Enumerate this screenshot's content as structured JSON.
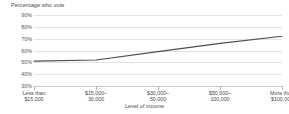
{
  "chart_data": {
    "type": "line",
    "title": "",
    "ylabel": "Percentage who vote",
    "xlabel": "Level of income",
    "categories": [
      "Less than\n$15,000",
      "$15,000–\n30,000",
      "$30,000–\n50,000",
      "$50,000–\n100,000",
      "More than\n$100,000"
    ],
    "category_lines": [
      [
        "Less than",
        "$15,000"
      ],
      [
        "$15,000–",
        "30,000"
      ],
      [
        "$30,000–",
        "50,000"
      ],
      [
        "$50,000–",
        "100,000"
      ],
      [
        "More than",
        "$100,000"
      ]
    ],
    "values": [
      51,
      52,
      59,
      66,
      72
    ],
    "ylim": [
      30,
      90
    ],
    "ytick_labels": [
      "90%",
      "80%",
      "70%",
      "60%",
      "50%",
      "40%",
      "30%"
    ],
    "ytick_values": [
      90,
      80,
      70,
      60,
      50,
      40,
      30
    ],
    "grid": true,
    "legend": "none",
    "line_color": "#4d4d4d",
    "grid_color": "#e2e2e2",
    "axis_color": "#c9c9c9",
    "text_color": "#4a4a4a",
    "background": "#ffffff"
  }
}
